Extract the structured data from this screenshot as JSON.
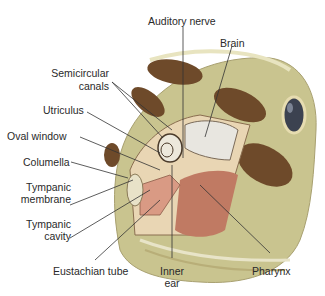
{
  "diagram": {
    "colors": {
      "skin": "#c9c48f",
      "skin_light": "#dcd9aa",
      "spots": "#6e4a2a",
      "eye": "#3c4250",
      "cavity": "#c07a63",
      "bone": "#e9d6b4",
      "brain": "#e8e6e0",
      "leader_line": "#333333"
    },
    "labels": {
      "auditory_nerve": "Auditory nerve",
      "brain": "Brain",
      "semicircular_1": "Semicircular",
      "semicircular_2": "canals",
      "utriculus": "Utriculus",
      "oval_window": "Oval window",
      "columella": "Columella",
      "tympanic_membrane_1": "Tympanic",
      "tympanic_membrane_2": "membrane",
      "tympanic_cavity_1": "Tympanic",
      "tympanic_cavity_2": "cavity",
      "eustachian_tube": "Eustachian tube",
      "inner_ear_1": "Inner",
      "inner_ear_2": "ear",
      "pharynx": "Pharynx"
    }
  }
}
